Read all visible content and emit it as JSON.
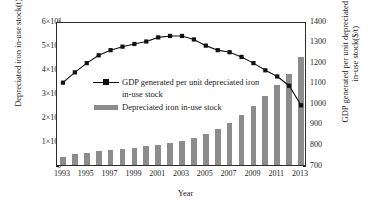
{
  "chart_data": {
    "type": "bar",
    "title": "",
    "xlabel": "Year",
    "categories": [
      1993,
      1994,
      1995,
      1996,
      1997,
      1998,
      1999,
      2000,
      2001,
      2002,
      2003,
      2004,
      2005,
      2006,
      2007,
      2008,
      2009,
      2010,
      2011,
      2012,
      2013
    ],
    "xtick_labels": [
      "1993",
      "1995",
      "1997",
      "1999",
      "2001",
      "2003",
      "2005",
      "2007",
      "2009",
      "2011",
      "2013"
    ],
    "grid": false,
    "legend_position": "upper-left-inside",
    "axes": {
      "left": {
        "label": "Depreciated iron in-use stock(t)",
        "ylim": [
          0,
          600000000
        ],
        "ticks": [
          0,
          100000000,
          200000000,
          300000000,
          400000000,
          500000000,
          600000000
        ],
        "tick_labels": [
          "0",
          "1×10⁸",
          "2×10⁸",
          "3×10⁸",
          "4×10⁸",
          "5×10⁸",
          "6×10⁸"
        ]
      },
      "right": {
        "label_line1": "GDP generated per unit depreciated iron",
        "label_line2": "in-use stock($/t)",
        "ylim": [
          700,
          1400
        ],
        "ticks": [
          700,
          800,
          900,
          1000,
          1100,
          1200,
          1300,
          1400
        ],
        "tick_labels": [
          "700",
          "800",
          "900",
          "1000",
          "1100",
          "1200",
          "1300",
          "1400"
        ]
      }
    },
    "series": [
      {
        "name": "Depreciated iron in-use stock",
        "type": "bar",
        "axis": "left",
        "color": "#8c8c8c",
        "legend_label": "Depreciated iron in-use stock",
        "values": [
          35000000,
          44000000,
          52000000,
          58000000,
          62000000,
          67000000,
          72000000,
          78000000,
          83000000,
          91000000,
          99000000,
          112000000,
          128000000,
          148000000,
          175000000,
          207000000,
          245000000,
          288000000,
          333000000,
          378000000,
          450000000
        ]
      },
      {
        "name": "GDP generated per unit depreciated iron in-use stock",
        "type": "line",
        "axis": "right",
        "color": "#111111",
        "marker": "square",
        "legend_label_line1": "GDP generated per unit depreciated iron",
        "legend_label_line2": "in-use stock",
        "values": [
          1110,
          1160,
          1205,
          1243,
          1268,
          1285,
          1298,
          1310,
          1330,
          1337,
          1337,
          1320,
          1290,
          1268,
          1258,
          1235,
          1205,
          1170,
          1140,
          1095,
          1000
        ]
      }
    ]
  }
}
